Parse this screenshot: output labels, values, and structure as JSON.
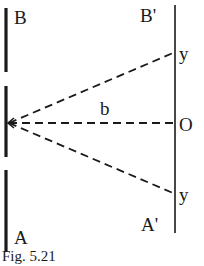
{
  "figure": {
    "caption": "Fig. 5.21",
    "labels": {
      "B": "B",
      "B_prime": "B'",
      "A": "A",
      "A_prime": "A'",
      "y_top": "y",
      "y_bottom": "y",
      "b": "b",
      "O": "O"
    },
    "colors": {
      "ink": "#1a1a1a",
      "background": "#ffffff"
    },
    "elements": {
      "left_barrier": "double slit barrier (three solid segments, two openings)",
      "right_screen": "screen line from B' to A'",
      "rays": [
        "dashed ray to upper y",
        "dashed ray to O (axis)",
        "dashed ray to lower y"
      ]
    }
  }
}
